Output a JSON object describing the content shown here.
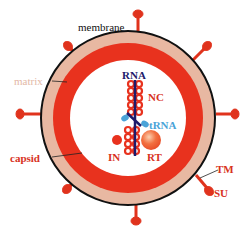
{
  "colors": {
    "membrane": "#111111",
    "matrix": "#e8b8a2",
    "capsid": "#e8321e",
    "spike": "#e0331d",
    "rna": "#1d1a6b",
    "nc": "#e8321e",
    "trna": "#4aa3d8",
    "rt": "#f06a3a",
    "label_red": "#d8321e",
    "label_matrix": "#e3b8a6",
    "label_dark": "#111111",
    "label_rna": "#1d1a6b",
    "label_trna": "#4aa3d8"
  },
  "labels": {
    "membrane": "membrane",
    "matrix": "matrix",
    "capsid": "capsid",
    "rna": "RNA",
    "nc": "NC",
    "trna": "tRNA",
    "in": "IN",
    "rt": "RT",
    "tm": "TM",
    "su": "SU"
  }
}
